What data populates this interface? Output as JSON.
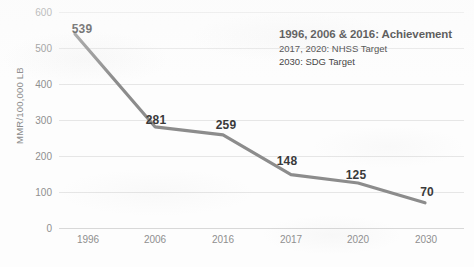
{
  "chart_data": {
    "type": "line",
    "title": "",
    "xlabel": "",
    "ylabel": "MMR/100,000 LB",
    "categories": [
      "1996",
      "2006",
      "2016",
      "2017",
      "2020",
      "2030"
    ],
    "values": [
      539,
      281,
      259,
      148,
      125,
      70
    ],
    "point_labels": [
      "539",
      "281",
      "259",
      "148",
      "125",
      "70"
    ],
    "ylim": [
      0,
      600
    ],
    "ytick_step": 100,
    "yticks": [
      "600",
      "500",
      "400",
      "300",
      "200",
      "100",
      "0"
    ],
    "grid": true,
    "legend_position": "none",
    "series_color": "#8c8c8c",
    "grid_color": "#e6e6e6",
    "label_color": "#8f8f8f",
    "annotations": [
      "1996, 2006 & 2016: Achievement",
      "2017, 2020: NHSS Target",
      "2030: SDG Target"
    ]
  },
  "annotation": {
    "heading": "1996, 2006 & 2016: Achievement",
    "line2": "2017, 2020: NHSS Target",
    "line3": "2030: SDG Target"
  },
  "caption": {
    "text": ""
  }
}
